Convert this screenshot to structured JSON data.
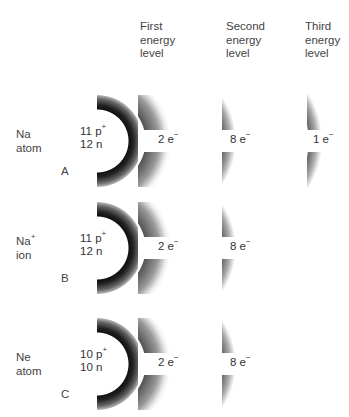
{
  "headers": [
    {
      "lines": [
        "First",
        "energy",
        "level"
      ]
    },
    {
      "lines": [
        "Second",
        "energy",
        "level"
      ]
    },
    {
      "lines": [
        "Third",
        "energy",
        "level"
      ]
    }
  ],
  "rows": [
    {
      "letter": "A",
      "species": "Na",
      "species_sup": "",
      "kind": "atom",
      "protons": "11 p",
      "neutrons": "12 n",
      "shells": [
        "2 e",
        "8 e",
        "1 e"
      ]
    },
    {
      "letter": "B",
      "species": "Na",
      "species_sup": "+",
      "kind": "ion",
      "protons": "11 p",
      "neutrons": "12 n",
      "shells": [
        "2 e",
        "8 e"
      ]
    },
    {
      "letter": "C",
      "species": "Ne",
      "species_sup": "",
      "kind": "atom",
      "protons": "10 p",
      "neutrons": "10 n",
      "shells": [
        "2 e",
        "8 e"
      ]
    }
  ],
  "charges": {
    "proton": "+",
    "electron": "−"
  }
}
